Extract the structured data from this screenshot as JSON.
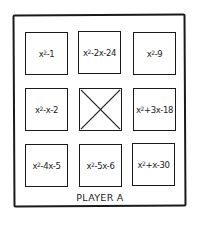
{
  "board": {
    "player_label": "PLAYER A",
    "tiles": [
      {
        "base": "x",
        "exp": "2",
        "rest": "-1"
      },
      {
        "base": "x",
        "exp": "2",
        "rest": "-2x-24"
      },
      {
        "base": "x",
        "exp": "2",
        "rest": "-9"
      },
      {
        "base": "x",
        "exp": "2",
        "rest": "-x-2"
      },
      {
        "crossed_out": true
      },
      {
        "base": "x",
        "exp": "2",
        "rest": "+3x-18"
      },
      {
        "base": "x",
        "exp": "2",
        "rest": "-4x-5"
      },
      {
        "base": "x",
        "exp": "2",
        "rest": "-5x-6"
      },
      {
        "base": "x",
        "exp": "2",
        "rest": "+x-30"
      }
    ]
  }
}
